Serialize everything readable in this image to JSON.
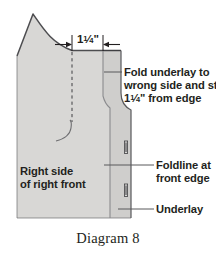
{
  "figure": {
    "caption": "Diagram 8",
    "dimension": {
      "whole": "1",
      "numerator": "1",
      "denominator": "4",
      "unit": "\"",
      "full_text": "1 1/4\""
    },
    "callouts": {
      "fold_underlay": {
        "line1": "Fold underlay to",
        "line2": "wrong side and stitch",
        "line3_whole": "1",
        "line3_num": "1",
        "line3_den": "4",
        "line3_rest": "\" from edge"
      },
      "foldline": {
        "line1": "Foldline at",
        "line2": "front edge"
      },
      "underlay": {
        "line1": "Underlay"
      }
    },
    "body_label": {
      "line1": "Right side",
      "line2": "of right front"
    },
    "colors": {
      "fabric_fill": "#d8d7d5",
      "underlay_fill": "#cfcecc",
      "outline": "#58585b",
      "text": "#231f20",
      "background": "#ffffff"
    },
    "markings": {
      "buttonhole_count": 2,
      "foldline_style": "solid",
      "stitchline_style": "dashed"
    }
  }
}
